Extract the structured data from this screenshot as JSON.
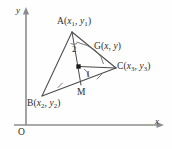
{
  "figure": {
    "background_color": "#fefefe",
    "line_color": "#4a4a4a",
    "axis_color": "#8c8c8c"
  },
  "axes": {
    "y_label": "y",
    "x_label": "x",
    "origin_label": "O"
  },
  "vertices": {
    "a_label": "A",
    "a_coords": "(x1, y1)",
    "a_x1": "x",
    "a_sub1": "1",
    "a_y1": "y",
    "a_sub2": "1",
    "b_label": "B",
    "b_coords": "(x2, y2)",
    "b_x": "x",
    "b_sub1": "2",
    "b_y": "y",
    "b_sub2": "2",
    "c_label": "C",
    "c_coords": "(x3, y3)",
    "c_x": "x",
    "c_sub1": "3",
    "c_y": "y",
    "c_sub2": "3"
  },
  "points": {
    "g_label": "G",
    "g_coords": "(x, y)",
    "g_x": "x",
    "g_y": "y",
    "m_label": "M"
  },
  "angles": {
    "angle_one": "1",
    "angle_two": "2"
  },
  "marks": {
    "bm_tick": "congruence-tick",
    "mc_tick": "congruence-tick"
  }
}
